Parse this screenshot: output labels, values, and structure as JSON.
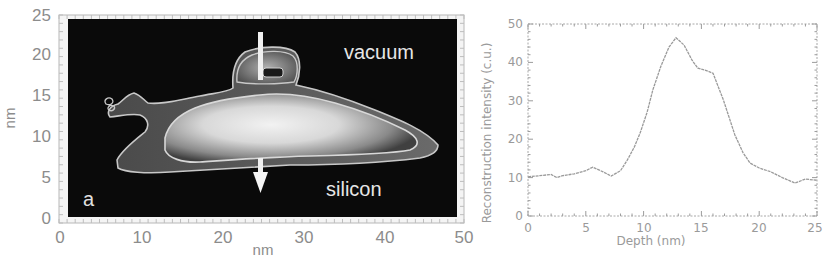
{
  "figure": {
    "left_panel": {
      "panel_letter": "a",
      "xlabel": "nm",
      "ylabel": "nm",
      "x_ticks": [
        "0",
        "10",
        "20",
        "30",
        "40",
        "50"
      ],
      "y_ticks": [
        "0",
        "5",
        "10",
        "15",
        "20",
        "25"
      ],
      "annotations": {
        "top": "vacuum",
        "bottom": "silicon"
      }
    },
    "right_panel": {
      "xlabel": "Depth (nm)",
      "ylabel": "Reconstruction intensity (c.u.)",
      "x_ticks": [
        "0",
        "5",
        "10",
        "15",
        "20",
        "25"
      ],
      "y_ticks": [
        "0",
        "10",
        "20",
        "30",
        "40",
        "50"
      ]
    },
    "colors": {
      "image_background": "#0a0a0a",
      "contour": "#c8c8c8",
      "curve": "#9a9a9a",
      "axis": "#9a9a9a"
    }
  },
  "chart_data": [
    {
      "type": "heatmap",
      "title": "",
      "description": "Grayscale 2D reconstruction image with contour lines; white arrow indicates line-profile direction from vacuum into silicon",
      "xlabel": "nm",
      "ylabel": "nm",
      "xlim": [
        0,
        50
      ],
      "ylim": [
        0,
        25
      ],
      "x_ticks": [
        0,
        10,
        20,
        30,
        40,
        50
      ],
      "y_ticks": [
        0,
        5,
        10,
        15,
        20,
        25
      ],
      "annotations": [
        {
          "text": "vacuum",
          "x": 35,
          "y": 21
        },
        {
          "text": "silicon",
          "x": 35,
          "y": 4
        },
        {
          "text": "a",
          "x": 3,
          "y": 2.5
        }
      ],
      "arrow": {
        "x": 25,
        "y_start": 23,
        "y_end": 2.5
      }
    },
    {
      "type": "line",
      "title": "",
      "xlabel": "Depth (nm)",
      "ylabel": "Reconstruction intensity (c.u.)",
      "xlim": [
        0,
        25
      ],
      "ylim": [
        0,
        50
      ],
      "grid": false,
      "legend": null,
      "x": [
        0,
        1,
        2,
        2.5,
        3,
        4,
        5,
        5.6,
        6.5,
        7.2,
        8,
        8.6,
        9.2,
        9.7,
        10.3,
        10.8,
        11.5,
        12.2,
        12.8,
        13.5,
        14.2,
        14.7,
        15.3,
        16.0,
        16.9,
        17.9,
        18.6,
        19.2,
        20,
        21,
        22,
        23.1,
        24,
        25
      ],
      "y": [
        10.2,
        10.5,
        10.8,
        10.0,
        10.5,
        11.0,
        11.8,
        12.7,
        11.5,
        10.4,
        11.8,
        14.6,
        18.0,
        21.6,
        27.0,
        32.8,
        39.0,
        44.0,
        46.4,
        44.5,
        40.5,
        38.5,
        38.0,
        37.2,
        30.2,
        21.1,
        16.5,
        13.8,
        12.5,
        11.5,
        10.0,
        8.6,
        9.6,
        9.3
      ]
    }
  ]
}
